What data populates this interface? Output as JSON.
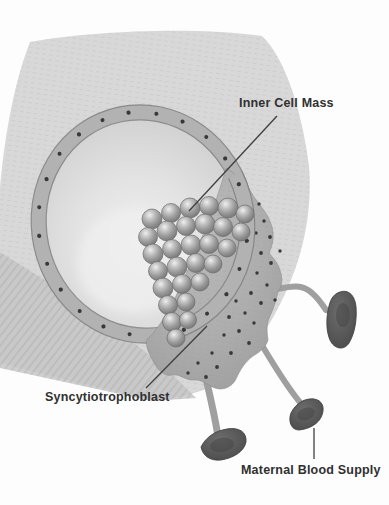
{
  "labels": {
    "inner_cell_mass": "Inner Cell Mass",
    "syncytiotrophoblast": "Syncytiotrophoblast",
    "maternal_blood_supply": "Maternal Blood Supply"
  },
  "colors": {
    "paper": "#fdfdfd",
    "wash": "#d8d8d8",
    "wash-dark": "#c7c7c7",
    "ring-band": "#b2b2b2",
    "ring-outline": "#7a7a7a",
    "cell-edge": "#6d6d6d",
    "nucleus": "#383838",
    "blood": "#5a5a5a",
    "blood-dark": "#434343",
    "leader-line": "#3f3f3f",
    "label-text": "#303030"
  }
}
